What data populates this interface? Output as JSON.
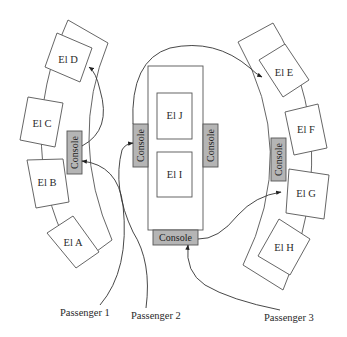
{
  "diagram": {
    "type": "elevator-lobby-layout",
    "groups": [
      {
        "id": "left-bank",
        "elevators": [
          "El D",
          "El C",
          "El B",
          "El A"
        ],
        "console_label": "Console"
      },
      {
        "id": "center-bank",
        "elevators": [
          "El J",
          "El I"
        ],
        "consoles": [
          "Console",
          "Console",
          "Console"
        ]
      },
      {
        "id": "right-bank",
        "elevators": [
          "El E",
          "El F",
          "El G",
          "El H"
        ],
        "console_label": "Console"
      }
    ],
    "labels": {
      "el_a": "El A",
      "el_b": "El B",
      "el_c": "El C",
      "el_d": "El D",
      "el_e": "El E",
      "el_f": "El F",
      "el_g": "El G",
      "el_h": "El H",
      "el_i": "El I",
      "el_j": "El J",
      "console_left": "Console",
      "console_center_left": "Console",
      "console_center_right": "Console",
      "console_center_bottom": "Console",
      "console_right": "Console"
    },
    "passengers": [
      {
        "label": "Passenger 1",
        "goes_to": "console_left",
        "then": "El D"
      },
      {
        "label": "Passenger 2",
        "goes_to": "console_center_left",
        "then": "El E"
      },
      {
        "label": "Passenger 3",
        "goes_to": "console_center_bottom",
        "then": "El G"
      }
    ],
    "colors": {
      "console_fill": "#b5b5b5",
      "stroke": "#555555",
      "background": "#ffffff"
    }
  }
}
